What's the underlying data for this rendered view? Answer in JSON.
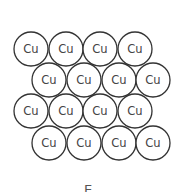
{
  "diagram": {
    "element_symbol": "Cu",
    "radius": 17,
    "rows": [
      {
        "y": 49,
        "xs": [
          31,
          66,
          100,
          135
        ]
      },
      {
        "y": 80,
        "xs": [
          49,
          84,
          119,
          153
        ]
      },
      {
        "y": 111,
        "xs": [
          31,
          66,
          100,
          135
        ]
      },
      {
        "y": 143,
        "xs": [
          49,
          84,
          119,
          153
        ]
      }
    ],
    "atoms": [
      {
        "label": "Cu"
      },
      {
        "label": "Cu"
      },
      {
        "label": "Cu"
      },
      {
        "label": "Cu"
      },
      {
        "label": "Cu"
      },
      {
        "label": "Cu"
      },
      {
        "label": "Cu"
      },
      {
        "label": "Cu"
      },
      {
        "label": "Cu"
      },
      {
        "label": "Cu"
      },
      {
        "label": "Cu"
      },
      {
        "label": "Cu"
      },
      {
        "label": "Cu"
      },
      {
        "label": "Cu"
      },
      {
        "label": "Cu"
      },
      {
        "label": "Cu"
      }
    ],
    "caption": "E",
    "colors": {
      "stroke": "#333333",
      "text": "#444444",
      "background": "#ffffff"
    }
  }
}
